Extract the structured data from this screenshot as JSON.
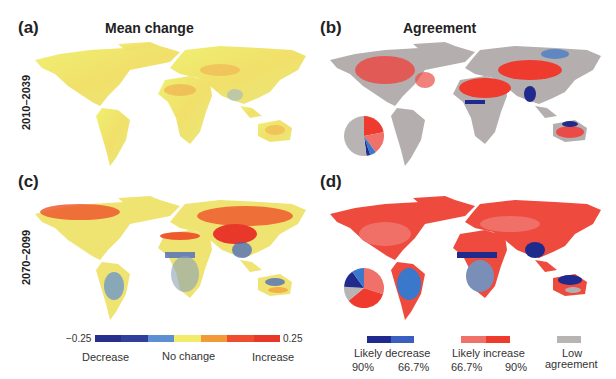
{
  "chart_data": {
    "type": "heatmap",
    "columns": [
      {
        "id": "mean_change",
        "title": "Mean change"
      },
      {
        "id": "agreement",
        "title": "Agreement"
      }
    ],
    "rows": [
      {
        "id": "near",
        "label": "2010–2039"
      },
      {
        "id": "far",
        "label": "2070–2099"
      }
    ],
    "panels": [
      {
        "label": "(a)",
        "column": "Mean change",
        "period": "2010–2039"
      },
      {
        "label": "(b)",
        "column": "Agreement",
        "period": "2010–2039",
        "pie": [
          {
            "category": "Likely increase 90%",
            "value": 22,
            "color": "#ee3b2e"
          },
          {
            "category": "Likely increase 66.7%",
            "value": 18,
            "color": "#f0706a"
          },
          {
            "category": "Likely decrease 66.7%",
            "value": 5,
            "color": "#3a78cc"
          },
          {
            "category": "Likely decrease 90%",
            "value": 3,
            "color": "#1f2a8c"
          },
          {
            "category": "Low agreement",
            "value": 52,
            "color": "#b8b4b4"
          }
        ]
      },
      {
        "label": "(c)",
        "column": "Mean change",
        "period": "2070–2099"
      },
      {
        "label": "(d)",
        "column": "Agreement",
        "period": "2070–2099",
        "pie": [
          {
            "category": "Likely increase 66.7%",
            "value": 30,
            "color": "#f0706a"
          },
          {
            "category": "Likely increase 90%",
            "value": 34,
            "color": "#ee3b2e"
          },
          {
            "category": "Low agreement",
            "value": 12,
            "color": "#b8b4b4"
          },
          {
            "category": "Likely decrease 90%",
            "value": 14,
            "color": "#1f2a8c"
          },
          {
            "category": "Likely decrease 66.7%",
            "value": 10,
            "color": "#3a78cc"
          }
        ]
      }
    ],
    "colorbar_mean": {
      "min": -0.25,
      "max": 0.25,
      "min_label": "-0.25",
      "max_label": "0.25",
      "labels": [
        "Decrease",
        "No change",
        "Increase"
      ],
      "colors": [
        "#262f8a",
        "#2f3f9a",
        "#5d8fd4",
        "#f2ec6a",
        "#f29a38",
        "#ee4d2e",
        "#e8382a"
      ]
    },
    "legend_agreement": [
      {
        "label": "Likely decrease",
        "sublabels": [
          "90%",
          "66.7%"
        ],
        "colors": [
          "#1f2a8c",
          "#3a5fc0"
        ]
      },
      {
        "label": "Likely increase",
        "sublabels": [
          "66.7%",
          "90%"
        ],
        "colors": [
          "#f0706a",
          "#ee3b2e"
        ]
      },
      {
        "label": "Low agreement",
        "sublabels": [],
        "colors": [
          "#b8b4b4"
        ]
      }
    ]
  },
  "text": {
    "a": "(a)",
    "b": "(b)",
    "c": "(c)",
    "d": "(d)",
    "title_mean": "Mean change",
    "title_agree": "Agreement",
    "row1": "2010–2039",
    "row2": "2070–2099",
    "cb_min": "−0.25",
    "cb_max": "0.25",
    "decrease": "Decrease",
    "nochange": "No change",
    "increase": "Increase",
    "likely_decrease": "Likely decrease",
    "likely_increase": "Likely increase",
    "ld_90": "90%",
    "ld_667": "66.7%",
    "li_667": "66.7%",
    "li_90": "90%",
    "low": "Low",
    "agreement": "agreement"
  }
}
